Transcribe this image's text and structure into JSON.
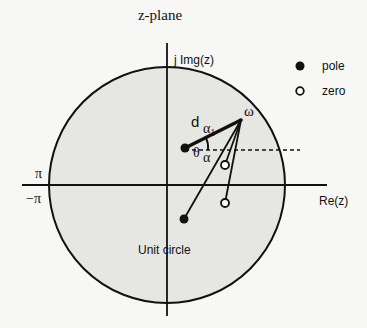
{
  "title": "z-plane",
  "axes": {
    "imag_label": "j Img(z)",
    "real_label": "Re(z)",
    "pi_label": "π",
    "neg_pi_label": "−π"
  },
  "legend": {
    "items": [
      {
        "marker": "filled-circle",
        "label": "pole"
      },
      {
        "marker": "open-circle",
        "label": "zero"
      }
    ]
  },
  "annotations": {
    "omega": "ω",
    "distance": "d",
    "alpha1": "α",
    "alpha1_sub": "1",
    "theta": "θ",
    "alpha": "α",
    "unit_circle": "Unit circle"
  },
  "colors": {
    "ink": "#111111",
    "circle_fill": "#e6e6e3",
    "background": "#f7f7f5"
  },
  "geometry": {
    "origin": [
      167,
      185
    ],
    "radius": 118,
    "omega_point": [
      241,
      120
    ],
    "poles": [
      [
        185,
        148
      ],
      [
        184,
        219
      ]
    ],
    "zeros": [
      [
        225,
        165
      ],
      [
        225,
        203
      ]
    ]
  }
}
